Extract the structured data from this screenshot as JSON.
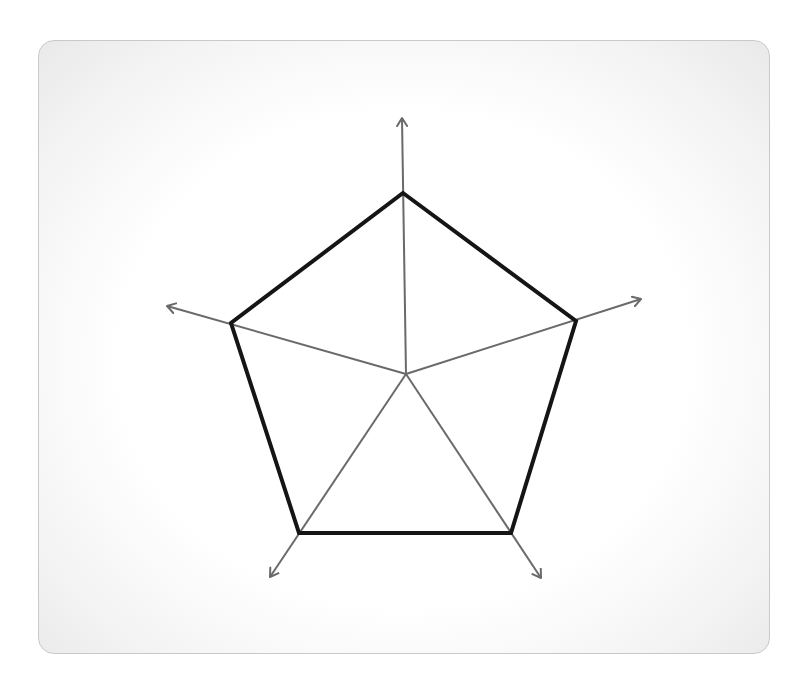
{
  "diagram": {
    "type": "radar-axes-pentagon",
    "center": [
      406,
      374
    ],
    "axes": [
      {
        "name": "axis-top",
        "vertex": [
          403,
          193
        ],
        "tip": [
          402,
          118
        ]
      },
      {
        "name": "axis-right",
        "vertex": [
          576,
          321
        ],
        "tip": [
          641,
          299
        ]
      },
      {
        "name": "axis-bottom-right",
        "vertex": [
          511,
          533
        ],
        "tip": [
          541,
          578
        ]
      },
      {
        "name": "axis-bottom-left",
        "vertex": [
          299,
          533
        ],
        "tip": [
          270,
          577
        ]
      },
      {
        "name": "axis-left",
        "vertex": [
          231,
          323
        ],
        "tip": [
          167,
          306
        ]
      }
    ],
    "colors": {
      "outline": "#151515",
      "spoke": "#6a6a6a",
      "panel_border": "#c9c9c9"
    },
    "outline_width": 4,
    "spoke_width": 2
  }
}
